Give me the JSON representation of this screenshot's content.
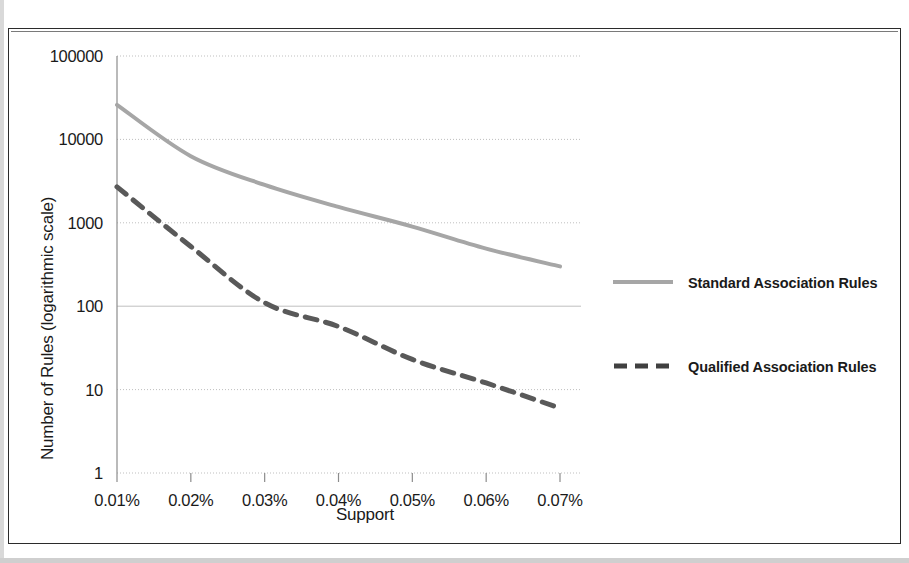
{
  "chart_data": {
    "type": "line",
    "title": "",
    "xlabel": "Support",
    "ylabel": "Number of Rules (logarithmic scale)",
    "x": [
      "0.01%",
      "0.02%",
      "0.03%",
      "0.04%",
      "0.05%",
      "0.06%",
      "0.07%"
    ],
    "x_tick_labels": [
      "0.01%",
      "0.02%",
      "0.03%",
      "0.04%",
      "0.05%",
      "0.06%",
      "0.07%"
    ],
    "y_tick_labels": [
      "100000",
      "10000",
      "1000",
      "100",
      "10",
      "1"
    ],
    "y_tick_values": [
      100000,
      10000,
      1000,
      100,
      10,
      1
    ],
    "yscale": "log",
    "ylim": [
      1,
      100000
    ],
    "grid": true,
    "legend_position": "right",
    "series": [
      {
        "name": "Standard Association Rules",
        "style": "solid",
        "color": "#a6a6a6",
        "values": [
          26000,
          6300,
          2850,
          1550,
          900,
          490,
          300
        ]
      },
      {
        "name": "Qualified Association Rules",
        "style": "dashed",
        "color": "#595959",
        "values": [
          2700,
          520,
          110,
          57,
          23,
          12,
          6
        ]
      }
    ]
  },
  "legend": {
    "items": [
      {
        "label": "Standard Association Rules",
        "style": "solid",
        "color": "#a6a6a6"
      },
      {
        "label": "Qualified Association Rules",
        "style": "dashed",
        "color": "#404040"
      }
    ]
  },
  "colors": {
    "standard_series": "#a6a6a6",
    "qualified_series": "#595959",
    "grid": "#bfbfbf",
    "axis": "#8c8c8c",
    "text": "#1a1a1a",
    "frame": "#2b2b2b"
  }
}
